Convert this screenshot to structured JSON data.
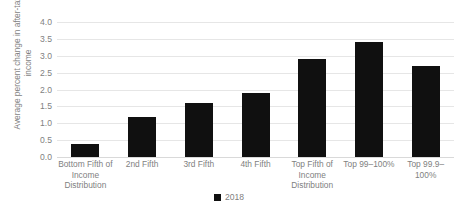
{
  "chart_data": {
    "type": "bar",
    "title": "",
    "xlabel": "",
    "ylabel": "Average percent change in after-tax income",
    "categories": [
      "Bottom Fifth of Income Distribution",
      "2nd Fifth",
      "3rd Fifth",
      "4th Fifth",
      "Top Fifth of Income Distribution",
      "Top 99–100%",
      "Top 99.9–100%"
    ],
    "values": [
      0.4,
      1.2,
      1.6,
      1.9,
      2.9,
      3.4,
      2.7
    ],
    "series": [
      {
        "name": "2018",
        "values": [
          0.4,
          1.2,
          1.6,
          1.9,
          2.9,
          3.4,
          2.7
        ],
        "color": "#101010"
      }
    ],
    "ylim": [
      0.0,
      4.0
    ],
    "ytick_step": 0.5,
    "ytick_labels": [
      "0.0",
      "0.5",
      "1.0",
      "1.5",
      "2.0",
      "2.5",
      "3.0",
      "3.5",
      "4.0"
    ],
    "grid": true,
    "grid_color": "#e6e6e6",
    "legend": {
      "position": "bottom-center",
      "entries": [
        {
          "label": "2018",
          "color": "#101010",
          "marker": "square"
        }
      ]
    }
  },
  "colors": {
    "bar": "#101010",
    "text": "#7f7f7f",
    "gridline": "#e6e6e6",
    "background": "#ffffff"
  }
}
